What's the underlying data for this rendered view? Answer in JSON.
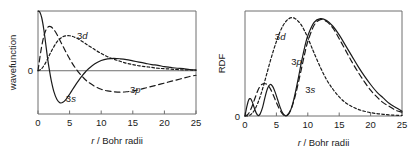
{
  "figure": {
    "background": "#ffffff",
    "ink": "#1a1a1a",
    "axis_color": "#6e6e6e"
  },
  "chart_data": [
    {
      "type": "line",
      "panel": "left",
      "title": "",
      "xlabel": "r / Bohr radii",
      "ylabel": "wavefunction",
      "xlim": [
        0,
        25
      ],
      "ylim": [
        -1.05,
        1.45
      ],
      "xticks": [
        0,
        5,
        10,
        15,
        20,
        25
      ],
      "xticklabels": [
        "0",
        "5",
        "10",
        "15",
        "20",
        "25"
      ],
      "yticks": [
        0
      ],
      "yticklabels": [
        "0"
      ],
      "grid": false,
      "legend": "inline-annotations",
      "zero_line": true,
      "annotations": [
        {
          "text": "3d",
          "x": 7.0,
          "y": 0.78,
          "series": "3d"
        },
        {
          "text": "3s",
          "x": 5.2,
          "y": -0.76,
          "series": "3s"
        },
        {
          "text": "3p",
          "x": 15.4,
          "y": -0.55,
          "series": "3p"
        }
      ],
      "series": [
        {
          "name": "3s",
          "style": "solid",
          "x": [
            0.0,
            0.3,
            0.6,
            0.9,
            1.2,
            1.5,
            1.8,
            2.1,
            2.5,
            3.0,
            3.5,
            4.0,
            4.5,
            5.0,
            5.5,
            6.0,
            6.5,
            7.0,
            7.5,
            8.0,
            9.0,
            10.0,
            11.0,
            12.0,
            13.0,
            14.0,
            15.0,
            16.0,
            17.0,
            18.0,
            19.0,
            20.0,
            21.0,
            22.0,
            23.0,
            24.0,
            25.0
          ],
          "y": [
            1.45,
            1.42,
            1.28,
            1.02,
            0.68,
            0.32,
            0.02,
            -0.24,
            -0.5,
            -0.7,
            -0.78,
            -0.76,
            -0.68,
            -0.57,
            -0.45,
            -0.33,
            -0.22,
            -0.12,
            -0.03,
            0.05,
            0.17,
            0.25,
            0.29,
            0.3,
            0.29,
            0.27,
            0.24,
            0.21,
            0.18,
            0.15,
            0.13,
            0.1,
            0.08,
            0.06,
            0.05,
            0.03,
            0.02
          ]
        },
        {
          "name": "3p",
          "style": "long-dash",
          "x": [
            0.0,
            0.5,
            1.0,
            1.5,
            2.0,
            2.5,
            3.0,
            3.5,
            4.0,
            4.5,
            5.0,
            5.5,
            6.0,
            6.5,
            7.0,
            7.5,
            8.0,
            9.0,
            10.0,
            11.0,
            12.0,
            13.0,
            14.0,
            15.0,
            16.0,
            17.0,
            18.0,
            19.0,
            20.0,
            21.0,
            22.0,
            23.0,
            24.0,
            25.0
          ],
          "y": [
            0.0,
            0.52,
            0.88,
            1.05,
            1.07,
            1.0,
            0.88,
            0.73,
            0.58,
            0.43,
            0.29,
            0.16,
            0.05,
            -0.05,
            -0.14,
            -0.22,
            -0.28,
            -0.38,
            -0.45,
            -0.49,
            -0.51,
            -0.52,
            -0.51,
            -0.49,
            -0.46,
            -0.42,
            -0.38,
            -0.34,
            -0.3,
            -0.26,
            -0.22,
            -0.18,
            -0.14,
            -0.11
          ]
        },
        {
          "name": "3d",
          "style": "short-dash",
          "x": [
            0.0,
            0.5,
            1.0,
            1.5,
            2.0,
            2.5,
            3.0,
            3.5,
            4.0,
            4.5,
            5.0,
            5.5,
            6.0,
            6.5,
            7.0,
            7.5,
            8.0,
            9.0,
            10.0,
            11.0,
            12.0,
            13.0,
            14.0,
            15.0,
            16.0,
            17.0,
            18.0,
            19.0,
            20.0,
            21.0,
            22.0,
            23.0,
            24.0,
            25.0
          ],
          "y": [
            0.0,
            0.04,
            0.14,
            0.28,
            0.44,
            0.58,
            0.7,
            0.78,
            0.83,
            0.85,
            0.85,
            0.83,
            0.8,
            0.76,
            0.71,
            0.66,
            0.61,
            0.51,
            0.42,
            0.34,
            0.28,
            0.23,
            0.18,
            0.15,
            0.12,
            0.1,
            0.08,
            0.06,
            0.05,
            0.04,
            0.03,
            0.02,
            0.02,
            0.01
          ]
        }
      ]
    },
    {
      "type": "line",
      "panel": "right",
      "title": "",
      "xlabel": "r / Bohr radii",
      "ylabel": "RDF",
      "xlim": [
        0,
        25
      ],
      "ylim": [
        0,
        1.1
      ],
      "xticks": [
        0,
        5,
        10,
        15,
        20,
        25
      ],
      "xticklabels": [
        "0",
        "5",
        "10",
        "15",
        "20",
        "25"
      ],
      "yticks": [
        0
      ],
      "yticklabels": [
        "0"
      ],
      "grid": false,
      "legend": "inline-annotations",
      "zero_line": false,
      "annotations": [
        {
          "text": "3d",
          "x": 5.6,
          "y": 0.8,
          "series": "3d"
        },
        {
          "text": "3p",
          "x": 8.2,
          "y": 0.53,
          "series": "3p"
        },
        {
          "text": "3s",
          "x": 10.4,
          "y": 0.24,
          "series": "3s"
        }
      ],
      "series": [
        {
          "name": "3s",
          "style": "solid",
          "x": [
            0.0,
            0.3,
            0.6,
            0.9,
            1.2,
            1.5,
            1.8,
            2.1,
            2.4,
            2.8,
            3.2,
            3.6,
            4.0,
            4.4,
            4.8,
            5.2,
            5.6,
            6.0,
            6.4,
            6.8,
            7.2,
            7.6,
            8.0,
            8.5,
            9.0,
            9.5,
            10.0,
            11.0,
            12.0,
            13.0,
            14.0,
            15.0,
            16.0,
            17.0,
            18.0,
            19.0,
            20.0,
            21.0,
            22.0,
            23.0,
            24.0,
            25.0
          ],
          "y": [
            0.0,
            0.1,
            0.17,
            0.18,
            0.14,
            0.08,
            0.03,
            0.005,
            0.02,
            0.09,
            0.2,
            0.29,
            0.33,
            0.31,
            0.25,
            0.17,
            0.09,
            0.03,
            0.004,
            0.01,
            0.05,
            0.13,
            0.24,
            0.4,
            0.57,
            0.72,
            0.84,
            0.98,
            1.02,
            1.0,
            0.94,
            0.85,
            0.74,
            0.63,
            0.52,
            0.42,
            0.33,
            0.25,
            0.19,
            0.13,
            0.09,
            0.05
          ]
        },
        {
          "name": "3p",
          "style": "long-dash",
          "x": [
            0.0,
            0.5,
            1.0,
            1.5,
            2.0,
            2.5,
            3.0,
            3.5,
            4.0,
            4.5,
            5.0,
            5.5,
            6.0,
            6.5,
            7.0,
            7.5,
            8.0,
            8.5,
            9.0,
            9.5,
            10.0,
            11.0,
            12.0,
            13.0,
            14.0,
            15.0,
            16.0,
            17.0,
            18.0,
            19.0,
            20.0,
            21.0,
            22.0,
            23.0,
            24.0,
            25.0
          ],
          "y": [
            0.0,
            0.02,
            0.08,
            0.17,
            0.26,
            0.32,
            0.34,
            0.33,
            0.29,
            0.22,
            0.14,
            0.07,
            0.02,
            0.003,
            0.03,
            0.1,
            0.21,
            0.35,
            0.5,
            0.65,
            0.78,
            0.95,
            1.01,
            0.99,
            0.92,
            0.81,
            0.69,
            0.57,
            0.46,
            0.36,
            0.27,
            0.2,
            0.14,
            0.1,
            0.06,
            0.04
          ]
        },
        {
          "name": "3d",
          "style": "short-dash",
          "x": [
            0.0,
            0.5,
            1.0,
            1.5,
            2.0,
            2.5,
            3.0,
            3.5,
            4.0,
            4.5,
            5.0,
            5.5,
            6.0,
            6.5,
            7.0,
            7.5,
            8.0,
            8.5,
            9.0,
            9.5,
            10.0,
            10.5,
            11.0,
            12.0,
            13.0,
            14.0,
            15.0,
            16.0,
            17.0,
            18.0,
            19.0,
            20.0,
            21.0,
            22.0,
            23.0,
            24.0,
            25.0
          ],
          "y": [
            0.0,
            0.003,
            0.02,
            0.06,
            0.13,
            0.22,
            0.33,
            0.45,
            0.57,
            0.68,
            0.78,
            0.87,
            0.94,
            0.99,
            1.02,
            1.03,
            1.02,
            0.99,
            0.95,
            0.89,
            0.82,
            0.74,
            0.66,
            0.51,
            0.38,
            0.28,
            0.2,
            0.14,
            0.1,
            0.07,
            0.05,
            0.035,
            0.025,
            0.018,
            0.012,
            0.008,
            0.005
          ]
        }
      ]
    }
  ]
}
